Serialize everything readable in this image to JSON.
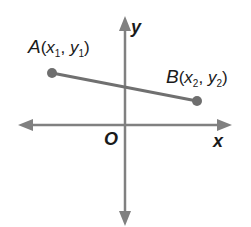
{
  "diagram": {
    "type": "coordinate-plane-segment",
    "colors": {
      "axis": "#808080",
      "segment": "#707070",
      "point": "#6e6e6e",
      "text": "#1a1a1a",
      "background": "#ffffff"
    },
    "axes": {
      "x_label": "x",
      "y_label": "y",
      "origin_label": "O"
    },
    "points": [
      {
        "id": "A",
        "letter": "A",
        "open": "(",
        "x_var": "x",
        "x_sub": "1",
        "sep": ", ",
        "y_var": "y",
        "y_sub": "1",
        "close": ")"
      },
      {
        "id": "B",
        "letter": "B",
        "open": "(",
        "x_var": "x",
        "x_sub": "2",
        "sep": ", ",
        "y_var": "y",
        "y_sub": "2",
        "close": ")"
      }
    ]
  }
}
